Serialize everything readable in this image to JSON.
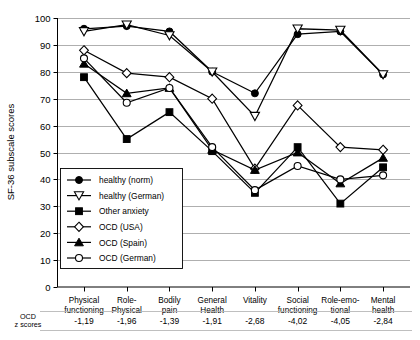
{
  "chart_data": {
    "type": "line",
    "title": "",
    "xlabel": "",
    "ylabel": "SF-36 subscale scores",
    "ylim": [
      0,
      100
    ],
    "ytick_labels": [
      "0",
      "10",
      "20",
      "30",
      "40",
      "50",
      "60",
      "70",
      "80",
      "90",
      "100"
    ],
    "yticks": [
      0,
      10,
      20,
      30,
      40,
      50,
      60,
      70,
      80,
      90,
      100
    ],
    "grid": true,
    "legend_position": "inside-lower-left",
    "categories": [
      "Physical functioning",
      "Role-Physical",
      "Bodily pain",
      "General Health",
      "Vitality",
      "Social functioning",
      "Role-emotional",
      "Mental health"
    ],
    "category_lines": [
      [
        "Physical",
        "functioning"
      ],
      [
        "Role-",
        "Physical"
      ],
      [
        "Bodily",
        "pain"
      ],
      [
        "General",
        "Health"
      ],
      [
        "Vitality",
        ""
      ],
      [
        "Social",
        "functioning"
      ],
      [
        "Role-emo-",
        "tional"
      ],
      [
        "Mental",
        "health"
      ]
    ],
    "series": [
      {
        "name": "healthy (norm)",
        "marker": "filled-circle",
        "values": [
          96,
          97,
          95,
          80,
          72,
          94,
          95,
          79
        ]
      },
      {
        "name": "healthy (German)",
        "marker": "open-triangle-down",
        "values": [
          95,
          97.5,
          93.5,
          80,
          63.5,
          96,
          95.5,
          79
        ]
      },
      {
        "name": "Other anxiety",
        "marker": "filled-square",
        "values": [
          78,
          55,
          65,
          50.5,
          35,
          52,
          31,
          44.5
        ]
      },
      {
        "name": "OCD (USA)",
        "marker": "open-diamond",
        "values": [
          88,
          79.5,
          78,
          70,
          44,
          67.5,
          52,
          51
        ]
      },
      {
        "name": "OCD (Spain)",
        "marker": "filled-triangle-up",
        "values": [
          83,
          72,
          74,
          51,
          43.5,
          50,
          38.5,
          48
        ]
      },
      {
        "name": "OCD (German)",
        "marker": "open-circle",
        "values": [
          85,
          68.5,
          74,
          52,
          36,
          45,
          40,
          41.5
        ]
      }
    ],
    "z_row_label_lines": [
      "OCD",
      "z scores"
    ],
    "z_scores": [
      "-1,19",
      "-1,96",
      "-1,39",
      "-1,91",
      "-2,68",
      "-4,02",
      "-4,05",
      "-2,84"
    ],
    "colors": {
      "ink": "#000000",
      "grid": "#9a9a9a",
      "background": "#ffffff"
    }
  }
}
